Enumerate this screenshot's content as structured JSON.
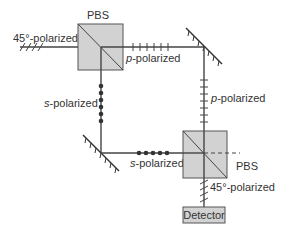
{
  "diagram": {
    "type": "optical-setup",
    "colors": {
      "beam": "#444444",
      "pbs_fill": "#d2d2d2",
      "detector_fill": "#d2d2d2",
      "text": "#333333"
    },
    "components": {
      "pbs_top": {
        "label": "PBS"
      },
      "pbs_bottom": {
        "label": "PBS"
      },
      "mirror_top_right": {
        "label": ""
      },
      "mirror_bottom_left": {
        "label": ""
      },
      "detector": {
        "label": "Detector"
      }
    },
    "labels": {
      "input": {
        "prefix": "45°-polarized"
      },
      "top_path": {
        "italic": "p",
        "rest": "-polarized"
      },
      "right_path": {
        "italic": "p",
        "rest": "-polarized"
      },
      "left_path": {
        "italic": "s",
        "rest": "-polarized"
      },
      "bottom_path": {
        "italic": "s",
        "rest": "-polarized"
      },
      "output": {
        "prefix": "45°-polarized"
      }
    }
  }
}
